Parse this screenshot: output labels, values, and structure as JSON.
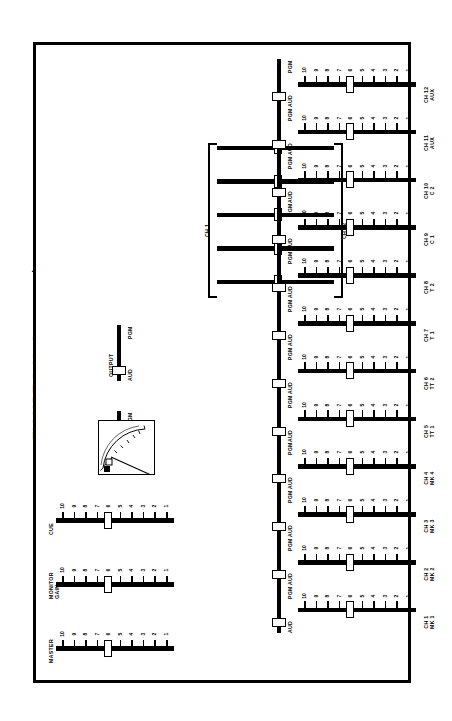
{
  "figure": {
    "number": "FIGURE 2.11",
    "caption": "Cue control"
  },
  "panel": {
    "title": "Cue control console"
  },
  "fader_scale": [
    "10",
    "9",
    "8",
    "7",
    "6",
    "5",
    "4",
    "3",
    "2",
    "1"
  ],
  "switch": {
    "top_label": "PGM",
    "bottom_label": "AUD"
  },
  "master_section": {
    "faders": [
      {
        "name": "cue-fader",
        "label": "CUE",
        "label2": "",
        "value": 6
      },
      {
        "name": "monitor-gain-fader",
        "label": "MONITOR",
        "label2": "GAIN",
        "value": 6
      },
      {
        "name": "master-fader",
        "label": "MASTER",
        "label2": "",
        "value": 6
      }
    ]
  },
  "source_switches": [
    {
      "name": "monitor-source-switch",
      "label": "MONITOR",
      "position": "PGM"
    },
    {
      "name": "output-source-switch",
      "label": "OUTPUT",
      "position": "AUD"
    }
  ],
  "meter": {
    "name": "vu-meter",
    "scale": [
      "20",
      "10",
      "7",
      "5",
      "3",
      "2",
      "1",
      "0",
      "1",
      "2",
      "3"
    ],
    "units": "VU"
  },
  "matrix": {
    "left_bracket_label": "CH 1",
    "right_bracket_label": "CH 12",
    "rows": [
      {
        "name": "bus-assign-row-1",
        "value": 52
      },
      {
        "name": "bus-assign-row-2",
        "value": 52
      },
      {
        "name": "bus-assign-row-3",
        "value": 52
      },
      {
        "name": "bus-assign-row-4",
        "value": 52
      },
      {
        "name": "bus-assign-row-5",
        "value": 52
      }
    ]
  },
  "channels": [
    {
      "id": "ch1",
      "label": "CH 1",
      "label2": "MK 1",
      "value": 6,
      "switch": "AUD"
    },
    {
      "id": "ch2",
      "label": "CH 2",
      "label2": "MK 2",
      "value": 6,
      "switch": "AUD"
    },
    {
      "id": "ch3",
      "label": "CH 3",
      "label2": "MK 3",
      "value": 6,
      "switch": "AUD"
    },
    {
      "id": "ch4",
      "label": "CH 4",
      "label2": "MK 4",
      "value": 6,
      "switch": "AUD"
    },
    {
      "id": "ch5",
      "label": "CH 5",
      "label2": "TT 1",
      "value": 6,
      "switch": "AUD"
    },
    {
      "id": "ch6",
      "label": "CH 6",
      "label2": "TT 2",
      "value": 6,
      "switch": "AUD"
    },
    {
      "id": "ch7",
      "label": "CH 7",
      "label2": "T 1",
      "value": 6,
      "switch": "AUD"
    },
    {
      "id": "ch8",
      "label": "CH 8",
      "label2": "T 2",
      "value": 6,
      "switch": "AUD"
    },
    {
      "id": "ch9",
      "label": "CH 9",
      "label2": "C 1",
      "value": 6,
      "switch": "AUD"
    },
    {
      "id": "ch10",
      "label": "CH 10",
      "label2": "C 2",
      "value": 6,
      "switch": "AUD"
    },
    {
      "id": "ch11",
      "label": "CH 11",
      "label2": "AUX",
      "value": 6,
      "switch": "AUD"
    },
    {
      "id": "ch12",
      "label": "CH 12",
      "label2": "AUX",
      "value": 6,
      "switch": "AUD"
    }
  ],
  "colors": {
    "ink": "#000000",
    "paper": "#ffffff"
  }
}
